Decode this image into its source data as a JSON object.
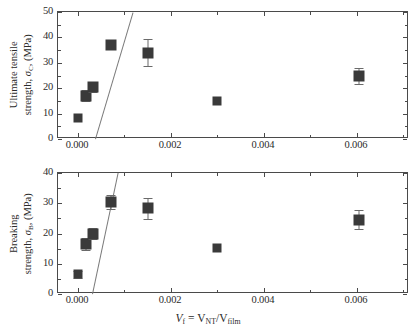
{
  "chart_data": [
    {
      "id": "top",
      "type": "scatter",
      "title": "",
      "xlabel": "V_f = V_NT/V_film",
      "ylabel": "Ultimate tensile strength, σ_C, (MPa)",
      "ylabel_line1": "Ultimate tensile",
      "ylabel_line2_pre": "strength, ",
      "ylabel_line2_sym": "σ",
      "ylabel_line2_sub": "C",
      "ylabel_line2_post": ", (MPa)",
      "xlim": [
        -0.00043,
        0.00712
      ],
      "ylim": [
        0,
        50
      ],
      "yticks": [
        0,
        10,
        20,
        30,
        40,
        50
      ],
      "yticklabels": [
        "0",
        "10",
        "20",
        "30",
        "40",
        "50"
      ],
      "yminor_step": 5,
      "xticks": [
        0.0,
        0.002,
        0.004,
        0.006
      ],
      "xticklabels": [
        "0.000",
        "0.002",
        "0.004",
        "0.006"
      ],
      "xminor_step": 0.001,
      "grid": false,
      "legend": "none",
      "series": [
        {
          "name": "Ultimate tensile strength",
          "marker": "filled-square",
          "color": "#3a3a3a",
          "points": [
            {
              "x": 0.0,
              "y": 8.1,
              "yerr": 0.0,
              "size": "sm"
            },
            {
              "x": 0.00018,
              "y": 17.0,
              "yerr": 2.1,
              "size": "lg"
            },
            {
              "x": 0.00033,
              "y": 20.4,
              "yerr": 1.8,
              "size": "lg"
            },
            {
              "x": 0.00072,
              "y": 37.1,
              "yerr": 0.0,
              "size": "lg"
            },
            {
              "x": 0.0015,
              "y": 34.0,
              "yerr": 5.2,
              "size": "lg"
            },
            {
              "x": 0.003,
              "y": 15.1,
              "yerr": 0.0,
              "size": "sm"
            },
            {
              "x": 0.00605,
              "y": 24.8,
              "yerr": 3.2,
              "size": "lg"
            }
          ]
        }
      ],
      "fit_line": {
        "name": "linear-fit",
        "color": "#7a7a7a",
        "x1": 0.00036,
        "y1": 0.0,
        "x2": 0.00117,
        "y2": 50.0
      }
    },
    {
      "id": "bottom",
      "type": "scatter",
      "title": "",
      "xlabel": "V_f = V_NT/V_film",
      "ylabel": "Breaking strength, σ_B, (MPa)",
      "ylabel_line1": "Breaking",
      "ylabel_line2_pre": "strength, ",
      "ylabel_line2_sym": "σ",
      "ylabel_line2_sub": "B",
      "ylabel_line2_post": ", (MPa)",
      "xlim": [
        -0.00043,
        0.00712
      ],
      "ylim": [
        0,
        40
      ],
      "yticks": [
        0,
        10,
        20,
        30,
        40
      ],
      "yticklabels": [
        "0",
        "10",
        "20",
        "30",
        "40"
      ],
      "yminor_step": 5,
      "xticks": [
        0.0,
        0.002,
        0.004,
        0.006
      ],
      "xticklabels": [
        "0.000",
        "0.002",
        "0.004",
        "0.006"
      ],
      "xminor_step": 0.001,
      "grid": false,
      "legend": "none",
      "series": [
        {
          "name": "Breaking strength",
          "marker": "filled-square",
          "color": "#3a3a3a",
          "points": [
            {
              "x": 0.0,
              "y": 6.5,
              "yerr": 1.1,
              "size": "sm"
            },
            {
              "x": 0.00018,
              "y": 16.4,
              "yerr": 2.0,
              "size": "lg"
            },
            {
              "x": 0.00033,
              "y": 20.0,
              "yerr": 1.8,
              "size": "lg"
            },
            {
              "x": 0.00072,
              "y": 30.4,
              "yerr": 2.4,
              "size": "lg"
            },
            {
              "x": 0.0015,
              "y": 28.4,
              "yerr": 3.5,
              "size": "lg"
            },
            {
              "x": 0.003,
              "y": 15.1,
              "yerr": 0.0,
              "size": "sm"
            },
            {
              "x": 0.00605,
              "y": 24.6,
              "yerr": 3.1,
              "size": "lg"
            }
          ]
        }
      ],
      "fit_line": {
        "name": "linear-fit",
        "color": "#7a7a7a",
        "x1": 0.0003,
        "y1": 0.0,
        "x2": 0.00085,
        "y2": 40.0
      }
    }
  ],
  "axis_titles": {
    "x_pre": "V",
    "x_sub1": "f",
    "x_mid": " = V",
    "x_sub2": "NT",
    "x_slash": "/V",
    "x_sub3": "film"
  },
  "colors": {
    "marker": "#3a3a3a",
    "errorbar": "#6a6a6a",
    "fit": "#7a7a7a",
    "axis": "#4a4a4a",
    "background": "#ffffff",
    "text": "#2b2b2b"
  }
}
